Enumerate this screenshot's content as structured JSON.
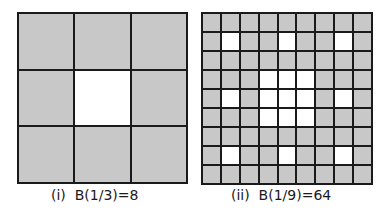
{
  "figures": [
    {
      "id": "i",
      "caption": "(i)  B(1/3)=8",
      "grid_size": 3,
      "holes": [
        [
          1,
          1
        ]
      ]
    },
    {
      "id": "ii",
      "caption": "(ii)  B(1/9)=64",
      "grid_size": 9,
      "holes": [
        [
          1,
          1
        ],
        [
          1,
          4
        ],
        [
          1,
          7
        ],
        [
          3,
          3
        ],
        [
          3,
          4
        ],
        [
          3,
          5
        ],
        [
          4,
          1
        ],
        [
          4,
          3
        ],
        [
          4,
          4
        ],
        [
          4,
          5
        ],
        [
          4,
          7
        ],
        [
          5,
          3
        ],
        [
          5,
          4
        ],
        [
          5,
          5
        ],
        [
          7,
          1
        ],
        [
          7,
          4
        ],
        [
          7,
          7
        ]
      ]
    }
  ],
  "colors": {
    "filled": "#c8c8c8",
    "hole": "#ffffff",
    "line": "#1a1a1a"
  }
}
